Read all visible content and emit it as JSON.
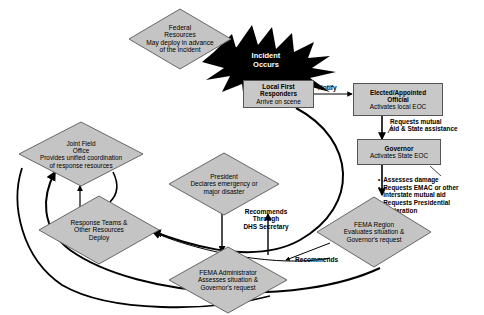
{
  "diagram": {
    "colors": {
      "node_fill": "#c4c4c4",
      "box_fill": "#c8c8c8",
      "node_stroke": "#666666",
      "incident_fill": "#000000",
      "incident_text": "#ffffff",
      "arrow": "#000000",
      "background": "#ffffff"
    },
    "nodes": [
      {
        "id": "federal-resources",
        "shape": "diamond",
        "title": "Federal Resources",
        "sub": "May deploy in advance of the incident"
      },
      {
        "id": "incident-occurs",
        "shape": "starburst",
        "title": "Incident Occurs",
        "sub": ""
      },
      {
        "id": "local-first-responders",
        "shape": "rectangle",
        "title": "Local First Responders",
        "sub": "Arrive on scene"
      },
      {
        "id": "elected-appointed-official",
        "shape": "rectangle",
        "title": "Elected/Appointed Official",
        "sub": "Activates local EOC"
      },
      {
        "id": "governor",
        "shape": "rectangle",
        "title": "Governor",
        "sub": "Activates State EOC"
      },
      {
        "id": "fema-region",
        "shape": "diamond",
        "title": "FEMA Region",
        "sub": "Evaluates situation & Governor's request"
      },
      {
        "id": "fema-administrator",
        "shape": "diamond",
        "title": "FEMA Administrator",
        "sub": "Assesses situation & Governor's request"
      },
      {
        "id": "president",
        "shape": "diamond",
        "title": "President",
        "sub": "Declares emergency or major disaster"
      },
      {
        "id": "response-teams",
        "shape": "diamond",
        "title": "Response Teams & Other Resources",
        "sub": "Deploy"
      },
      {
        "id": "joint-field-office",
        "shape": "diamond",
        "title": "Joint Field Office",
        "sub": "Provides unified coordination of response resources"
      }
    ],
    "node_text": {
      "federal_resources_l1": "Federal",
      "federal_resources_l2": "Resources",
      "federal_resources_l3": "May deploy in advance",
      "federal_resources_l4": "of the incident",
      "incident_l1": "Incident",
      "incident_l2": "Occurs",
      "local_first_l1": "Local First",
      "local_first_l2": "Responders",
      "local_first_l3": "Arrive on scene",
      "elected_l1": "Elected/Appointed",
      "elected_l2": "Official",
      "elected_l3": "Activates local EOC",
      "governor_l1": "Governor",
      "governor_l2": "Activates State EOC",
      "fema_region_l1": "FEMA Region",
      "fema_region_l2": "Evaluates situation &",
      "fema_region_l3": "Governor's request",
      "fema_admin_l1": "FEMA Administrator",
      "fema_admin_l2": "Assesses situation &",
      "fema_admin_l3": "Governor's request",
      "president_l1": "President",
      "president_l2": "Declares emergency or",
      "president_l3": "major disaster",
      "response_teams_l1": "Response Teams &",
      "response_teams_l2": "Other Resources",
      "response_teams_l3": "Deploy",
      "jfo_l1": "Joint Field",
      "jfo_l2": "Office",
      "jfo_l3": "Provides unified coordination",
      "jfo_l4": "of response resources"
    },
    "edge_labels": {
      "notify": "Notify",
      "requests_mutual_l1": "Requests mutual",
      "requests_mutual_l2": "aid & State assistance",
      "recommends_through_l1": "Recommends",
      "recommends_through_l2": "Through",
      "recommends_through_l3": "DHS Secretary",
      "recommends": "Recommends"
    },
    "governor_actions": {
      "label": "Governor actions",
      "items": [
        "Assesses damage",
        "Requests EMAC or other interstate mutual aid",
        "Requests Presidential declaration"
      ],
      "item_lines": [
        [
          "Assesses damage"
        ],
        [
          "Requests EMAC or",
          "other interstate",
          "mutual aid"
        ],
        [
          "Requests",
          "Presidential",
          "declaration"
        ]
      ]
    }
  }
}
